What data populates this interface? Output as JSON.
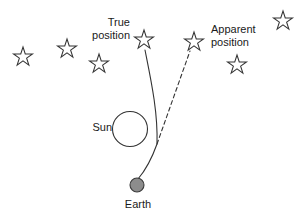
{
  "diagram": {
    "title_text": "",
    "background_color": "#ffffff",
    "stroke_color": "#333333",
    "text_color": "#1a1a1a",
    "earth_fill_color": "#8c8c8c",
    "sun_fill_color": "#ffffff",
    "labels": {
      "true_position": "True\nposition",
      "apparent_position": "Apparent\nposition",
      "sun": "Sun",
      "earth": "Earth"
    },
    "bodies": [
      {
        "name": "sun",
        "shape": "circle-outline",
        "cx": 130,
        "cy": 129,
        "r": 17.5
      },
      {
        "name": "earth",
        "shape": "circle-filled",
        "cx": 137,
        "cy": 185,
        "r": 7
      }
    ],
    "stars": [
      {
        "name": "star-far-left-lower",
        "cx": 23,
        "cy": 57,
        "r": 10,
        "rotation": 0
      },
      {
        "name": "star-left-upper",
        "cx": 67,
        "cy": 49,
        "r": 10,
        "rotation": 0
      },
      {
        "name": "star-below-true-label",
        "cx": 99,
        "cy": 64,
        "r": 10,
        "rotation": 0
      },
      {
        "name": "star-true-position",
        "cx": 144,
        "cy": 40,
        "r": 10,
        "rotation": 0
      },
      {
        "name": "star-apparent-position",
        "cx": 194,
        "cy": 42,
        "r": 10,
        "rotation": 0
      },
      {
        "name": "star-below-apparent-label",
        "cx": 237,
        "cy": 65,
        "r": 10,
        "rotation": 0
      },
      {
        "name": "star-top-right",
        "cx": 283,
        "cy": 21,
        "r": 10,
        "rotation": 0
      }
    ],
    "paths": {
      "true_light_path": {
        "style": "solid",
        "description": "curved light ray from true star position bending around Sun to Earth",
        "d": "M 145 50 C 151 80 158 112 157 144 C 152 158 144 172 138 179"
      },
      "apparent_light_path": {
        "style": "dashed",
        "description": "straight dashed line of sight from Earth to apparent star position",
        "d": "M 157 144 L 190 51",
        "dash_pattern": "4 3"
      }
    }
  }
}
